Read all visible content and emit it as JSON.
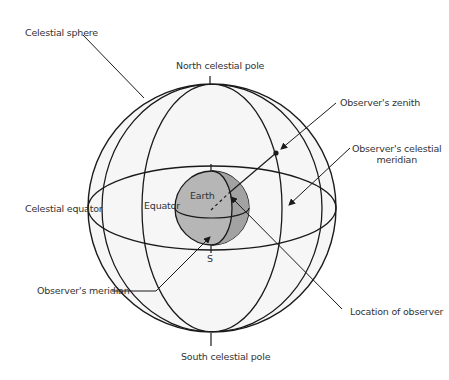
{
  "diagram": {
    "title": "",
    "colors": {
      "sphere_fill": "#f5f5f5",
      "earth_fill": "#b4b4b4",
      "earth_shade": "#9a9a9a",
      "line": "#1a1a1a",
      "text": "#333333"
    },
    "labels": {
      "celestial_sphere": "Celestial sphere",
      "north_celestial_pole": "North celestial pole",
      "observers_zenith": "Observer's zenith",
      "observers_celestial_meridian_1": "Observer's celestial",
      "observers_celestial_meridian_2": "meridian",
      "celestial_equator": "Celestial equator",
      "equator": "Equator",
      "earth": "Earth",
      "s": "S",
      "observers_meridian": "Observer's meridian",
      "location_of_observer": "Location of observer",
      "south_celestial_pole": "South celestial pole"
    },
    "nodes": [
      "Celestial sphere",
      "Earth",
      "Observer's zenith",
      "North celestial pole",
      "South celestial pole"
    ],
    "edges": [
      {
        "from": "Celestial sphere",
        "to": "sphere outline",
        "type": "pointer"
      },
      {
        "from": "Observer's zenith",
        "to": "zenith point",
        "type": "arrow"
      },
      {
        "from": "Observer's celestial meridian",
        "to": "celestial meridian arc",
        "type": "arrow"
      },
      {
        "from": "Observer's meridian",
        "to": "earth meridian",
        "type": "arrow"
      },
      {
        "from": "Location of observer",
        "to": "observer point on Earth",
        "type": "arrow"
      }
    ]
  }
}
